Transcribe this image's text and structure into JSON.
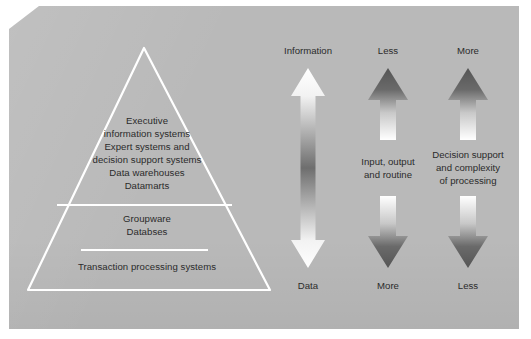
{
  "figure": {
    "background_color": "#b9b9b9",
    "page_color": "#ffffff",
    "outline_color": "#ffffff",
    "text_color": "#2b2b2b",
    "arrow_dark_color": "#5f5f5f",
    "arrow_light_color": "#ffffff"
  },
  "pyramid": {
    "tiers": [
      {
        "name": "top",
        "text": "Executive\ninformation systems\nExpert systems and\ndecision support systems\nData warehouses\nDatamarts"
      },
      {
        "name": "middle",
        "text": "Groupware\nDatabses"
      },
      {
        "name": "bottom",
        "text": "Transaction processing systems"
      }
    ]
  },
  "arrow_columns": [
    {
      "name": "information",
      "top_label": "Information",
      "bottom_label": "Data",
      "middle_label": "",
      "style": "double-headed"
    },
    {
      "name": "input-output-routine",
      "top_label": "Less",
      "bottom_label": "More",
      "middle_label": "Input, output\nand routine",
      "style": "split-pair"
    },
    {
      "name": "decision-support",
      "top_label": "More",
      "bottom_label": "Less",
      "middle_label": "Decision support\nand complexity\nof processing",
      "style": "split-pair"
    }
  ]
}
